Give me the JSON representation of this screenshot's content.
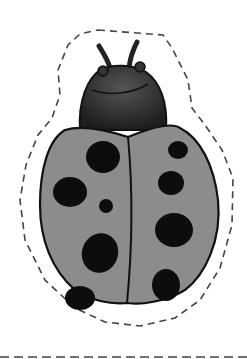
{
  "image": {
    "subject": "ladybug cut-out illustration",
    "colors": {
      "background": "#ffffff",
      "shell": "#8c8c8c",
      "head": "#2e2e2e",
      "outline": "#111111",
      "spots": "#0d0d0d",
      "cut_line": "#444444"
    },
    "spots_count": 11
  }
}
